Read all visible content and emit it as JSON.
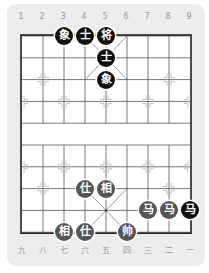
{
  "colors": {
    "card_bg": "#ececec",
    "board_bg": "#ffffff",
    "grid_line": "#555555",
    "frame": "#222222",
    "black_piece": "#111111",
    "red_piece": "#555555",
    "piece_text": "#ffffff",
    "label": "#9a9a9a"
  },
  "top_labels": [
    "1",
    "2",
    "3",
    "4",
    "5",
    "6",
    "7",
    "8",
    "9"
  ],
  "bottom_labels": [
    "九",
    "八",
    "七",
    "六",
    "五",
    "四",
    "三",
    "二",
    "一"
  ],
  "pieces": [
    {
      "char": "象",
      "side": "black",
      "col": 3,
      "row": 0
    },
    {
      "char": "士",
      "side": "black",
      "col": 4,
      "row": 0
    },
    {
      "char": "将",
      "side": "black",
      "col": 5,
      "row": 0
    },
    {
      "char": "士",
      "side": "black",
      "col": 5,
      "row": 1
    },
    {
      "char": "象",
      "side": "black",
      "col": 5,
      "row": 2
    },
    {
      "char": "仕",
      "side": "red",
      "col": 4,
      "row": 7
    },
    {
      "char": "相",
      "side": "red",
      "col": 5,
      "row": 7
    },
    {
      "char": "马",
      "side": "red",
      "col": 7,
      "row": 8
    },
    {
      "char": "马",
      "side": "red",
      "col": 8,
      "row": 8
    },
    {
      "char": "马",
      "side": "black",
      "col": 9,
      "row": 8
    },
    {
      "char": "相",
      "side": "red",
      "col": 3,
      "row": 9
    },
    {
      "char": "仕",
      "side": "red",
      "col": 4,
      "row": 9
    },
    {
      "char": "帅",
      "side": "red",
      "col": 6,
      "row": 9
    }
  ]
}
